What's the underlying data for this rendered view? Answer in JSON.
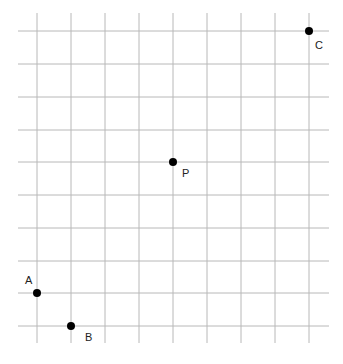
{
  "diagram": {
    "type": "grid-points",
    "grid": {
      "columns_x": [
        37,
        71,
        105,
        139,
        173,
        207,
        241,
        275,
        309
      ],
      "rows_y": [
        31,
        64,
        97,
        130,
        162,
        195,
        228,
        261,
        293,
        326
      ],
      "h_extent": [
        18,
        329
      ],
      "v_extent": [
        13,
        343
      ],
      "line_color": "#b8b8b8",
      "background": "#ffffff"
    },
    "points": [
      {
        "name": "C",
        "col": 8,
        "row": 0,
        "x": 309,
        "y": 31,
        "label_dx": 6,
        "label_dy": 18
      },
      {
        "name": "P",
        "col": 4,
        "row": 4,
        "x": 173,
        "y": 162,
        "label_dx": 9,
        "label_dy": 15
      },
      {
        "name": "A",
        "col": 0,
        "row": 8,
        "x": 37,
        "y": 293,
        "label_dx": -12,
        "label_dy": -9
      },
      {
        "name": "B",
        "col": 1,
        "row": 9,
        "x": 71,
        "y": 326,
        "label_dx": 14,
        "label_dy": 15
      }
    ],
    "point_color": "#000000",
    "point_radius": 4
  }
}
